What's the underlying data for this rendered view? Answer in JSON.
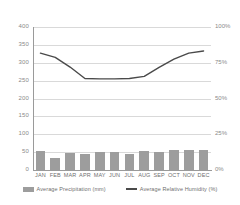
{
  "chart_data": {
    "type": "bar",
    "title": "",
    "subtitle": "",
    "xlabel": "",
    "ylabel": "",
    "categories": [
      "JAN",
      "FEB",
      "MAR",
      "APR",
      "MAY",
      "JUN",
      "JUL",
      "AUG",
      "SEP",
      "OCT",
      "NOV",
      "DEC"
    ],
    "grid": true,
    "legend_position": "bottom",
    "series": [
      {
        "name": "Average Precipitation (mm)",
        "type": "bar",
        "axis": "left",
        "color": "#9d9d9d",
        "values": [
          52,
          35,
          48,
          46,
          49,
          49,
          46,
          52,
          50,
          55,
          55,
          55
        ]
      },
      {
        "name": "Average Relative Humidity (%)",
        "type": "line",
        "axis": "right",
        "color": "#4a4a4a",
        "values_mm_scale": [
          327,
          315,
          288,
          256,
          255,
          255,
          256,
          262,
          287,
          310,
          327,
          333
        ],
        "values": [
          82,
          79,
          72,
          64,
          64,
          64,
          64,
          66,
          72,
          78,
          82,
          83
        ]
      }
    ],
    "left_axis": {
      "min": 0,
      "max": 400,
      "ticks": [
        0,
        50,
        100,
        150,
        200,
        250,
        300,
        350,
        400
      ],
      "tick_labels": [
        "0",
        "50",
        "100",
        "150",
        "200",
        "250",
        "300",
        "350",
        "400"
      ]
    },
    "right_axis": {
      "min": 0,
      "max": 100,
      "ticks": [
        0,
        25,
        50,
        75,
        100
      ],
      "tick_labels": [
        "0%",
        "25%",
        "50%",
        "75%",
        "100%"
      ]
    },
    "legend": [
      {
        "label": "Average Precipitation (mm)",
        "swatch": "bar",
        "color": "#9d9d9d"
      },
      {
        "label": "Average Relative Humidity (%)",
        "swatch": "line",
        "color": "#4a4a4a"
      }
    ]
  }
}
